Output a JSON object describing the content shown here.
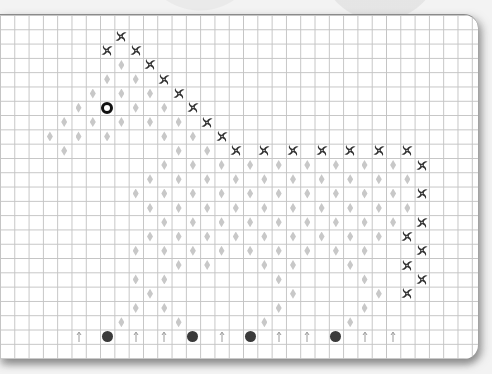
{
  "grid": {
    "cols": 33,
    "rows": 24,
    "cell_px": 14.3,
    "line_color": "#c4c4c4"
  },
  "colors": {
    "diamond": "#c8c8c8",
    "swirl": "#2e2e2e",
    "dot": "#3a3a3a",
    "ring": "#111111"
  },
  "legend_symbols": {
    "swirl": "swirl-icon (outline stitch)",
    "diamond": "diamond-icon (fill stitch)",
    "ring": "ring-icon (eye)",
    "dot": "dot-icon (bobble)",
    "arrow": "arrow-up-icon"
  },
  "symbols": {
    "swirl": [
      [
        8,
        1
      ],
      [
        7,
        2
      ],
      [
        9,
        2
      ],
      [
        10,
        3
      ],
      [
        11,
        4
      ],
      [
        12,
        5
      ],
      [
        13,
        6
      ],
      [
        14,
        7
      ],
      [
        15,
        8
      ],
      [
        16,
        9
      ],
      [
        18,
        9
      ],
      [
        20,
        9
      ],
      [
        22,
        9
      ],
      [
        24,
        9
      ],
      [
        26,
        9
      ],
      [
        28,
        9
      ],
      [
        29,
        10
      ],
      [
        29,
        12
      ],
      [
        29,
        14
      ],
      [
        28,
        15
      ],
      [
        29,
        16
      ],
      [
        28,
        17
      ],
      [
        29,
        18
      ],
      [
        28,
        19
      ]
    ],
    "ring": [
      [
        7,
        6
      ]
    ],
    "dot": [
      [
        7,
        22
      ],
      [
        13,
        22
      ],
      [
        17,
        22
      ],
      [
        23,
        22
      ]
    ],
    "arrow": [
      [
        5,
        22
      ],
      [
        9,
        22
      ],
      [
        11,
        22
      ],
      [
        15,
        22
      ],
      [
        19,
        22
      ],
      [
        21,
        22
      ],
      [
        25,
        22
      ],
      [
        27,
        22
      ]
    ],
    "diamond": [
      [
        8,
        3
      ],
      [
        7,
        4
      ],
      [
        9,
        4
      ],
      [
        6,
        5
      ],
      [
        8,
        5
      ],
      [
        10,
        5
      ],
      [
        5,
        6
      ],
      [
        9,
        6
      ],
      [
        11,
        6
      ],
      [
        4,
        7
      ],
      [
        6,
        7
      ],
      [
        8,
        7
      ],
      [
        10,
        7
      ],
      [
        12,
        7
      ],
      [
        3,
        8
      ],
      [
        5,
        8
      ],
      [
        7,
        8
      ],
      [
        11,
        8
      ],
      [
        13,
        8
      ],
      [
        4,
        9
      ],
      [
        12,
        9
      ],
      [
        14,
        9
      ],
      [
        11,
        10
      ],
      [
        13,
        10
      ],
      [
        15,
        10
      ],
      [
        17,
        10
      ],
      [
        19,
        10
      ],
      [
        21,
        10
      ],
      [
        23,
        10
      ],
      [
        25,
        10
      ],
      [
        27,
        10
      ],
      [
        10,
        11
      ],
      [
        12,
        11
      ],
      [
        14,
        11
      ],
      [
        16,
        11
      ],
      [
        18,
        11
      ],
      [
        20,
        11
      ],
      [
        22,
        11
      ],
      [
        24,
        11
      ],
      [
        26,
        11
      ],
      [
        28,
        11
      ],
      [
        9,
        12
      ],
      [
        11,
        12
      ],
      [
        13,
        12
      ],
      [
        15,
        12
      ],
      [
        17,
        12
      ],
      [
        19,
        12
      ],
      [
        21,
        12
      ],
      [
        23,
        12
      ],
      [
        25,
        12
      ],
      [
        27,
        12
      ],
      [
        10,
        13
      ],
      [
        12,
        13
      ],
      [
        14,
        13
      ],
      [
        16,
        13
      ],
      [
        18,
        13
      ],
      [
        20,
        13
      ],
      [
        22,
        13
      ],
      [
        24,
        13
      ],
      [
        26,
        13
      ],
      [
        28,
        13
      ],
      [
        11,
        14
      ],
      [
        13,
        14
      ],
      [
        15,
        14
      ],
      [
        17,
        14
      ],
      [
        19,
        14
      ],
      [
        21,
        14
      ],
      [
        23,
        14
      ],
      [
        25,
        14
      ],
      [
        27,
        14
      ],
      [
        10,
        15
      ],
      [
        12,
        15
      ],
      [
        14,
        15
      ],
      [
        16,
        15
      ],
      [
        18,
        15
      ],
      [
        20,
        15
      ],
      [
        22,
        15
      ],
      [
        24,
        15
      ],
      [
        26,
        15
      ],
      [
        9,
        16
      ],
      [
        11,
        16
      ],
      [
        13,
        16
      ],
      [
        15,
        16
      ],
      [
        17,
        16
      ],
      [
        19,
        16
      ],
      [
        21,
        16
      ],
      [
        23,
        16
      ],
      [
        25,
        16
      ],
      [
        12,
        17
      ],
      [
        14,
        17
      ],
      [
        18,
        17
      ],
      [
        20,
        17
      ],
      [
        24,
        17
      ],
      [
        9,
        18
      ],
      [
        11,
        18
      ],
      [
        19,
        18
      ],
      [
        25,
        18
      ],
      [
        10,
        19
      ],
      [
        20,
        19
      ],
      [
        26,
        19
      ],
      [
        9,
        20
      ],
      [
        11,
        20
      ],
      [
        19,
        20
      ],
      [
        25,
        20
      ],
      [
        8,
        21
      ],
      [
        12,
        21
      ],
      [
        18,
        21
      ],
      [
        24,
        21
      ]
    ]
  }
}
